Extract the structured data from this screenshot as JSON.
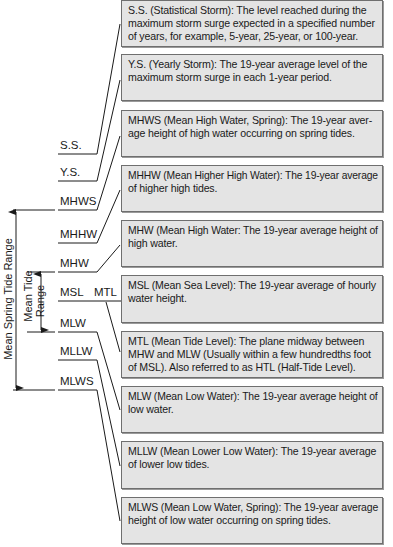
{
  "diagram": {
    "level_labels": [
      {
        "id": "ss",
        "label": "S.S."
      },
      {
        "id": "ys",
        "label": "Y.S."
      },
      {
        "id": "mhws",
        "label": "MHWS"
      },
      {
        "id": "mhhw",
        "label": "MHHW"
      },
      {
        "id": "mhw",
        "label": "MHW"
      },
      {
        "id": "msl",
        "label": "MSL"
      },
      {
        "id": "mtl",
        "label": "MTL"
      },
      {
        "id": "mlw",
        "label": "MLW"
      },
      {
        "id": "mllw",
        "label": "MLLW"
      },
      {
        "id": "mlws",
        "label": "MLWS"
      }
    ],
    "ranges": {
      "spring": "Mean Spring Tide Range",
      "tide_line1": "Mean Tide",
      "tide_line2": "Range"
    },
    "definitions": [
      {
        "id": "ss",
        "lines": [
          "S.S. (Statistical Storm): The level reached during the",
          "maximum storm surge expected in a specified number",
          "of years, for example, 5-year, 25-year, or 100-year."
        ]
      },
      {
        "id": "ys",
        "lines": [
          "Y.S. (Yearly Storm): The 19-year average level of the",
          "maximum storm surge in each 1-year period."
        ]
      },
      {
        "id": "mhws",
        "lines": [
          "MHWS (Mean High Water, Spring): The 19-year aver-",
          "age height of high water occurring on spring tides."
        ]
      },
      {
        "id": "mhhw",
        "lines": [
          "MHHW (Mean Higher High Water): The 19-year average",
          "of higher high tides."
        ]
      },
      {
        "id": "mhw",
        "lines": [
          "MHW (Mean High Water: The 19-year average height of",
          "high water."
        ]
      },
      {
        "id": "msl",
        "lines": [
          "MSL (Mean Sea Level): The 19-year average of hourly",
          "water height."
        ]
      },
      {
        "id": "mtl",
        "lines": [
          "MTL (Mean Tide Level): The plane midway between",
          "MHW and MLW (Usually within a few hundredths foot",
          "of MSL). Also referred to as HTL (Half-Tide Level)."
        ]
      },
      {
        "id": "mlw",
        "lines": [
          "MLW (Mean Low Water): The 19-year average height of",
          "low water."
        ]
      },
      {
        "id": "mllw",
        "lines": [
          "MLLW (Mean Lower Low Water): The 19-year average",
          "of lower low tides."
        ]
      },
      {
        "id": "mlws",
        "lines": [
          "MLWS (Mean Low Water, Spring): The 19-year average",
          "height of low water occurring on spring tides."
        ]
      }
    ],
    "colors": {
      "box_fill": "#e4e4e4",
      "box_border": "#6f6f6f",
      "line": "#1a1a1a",
      "text": "#1a1a1a"
    }
  }
}
